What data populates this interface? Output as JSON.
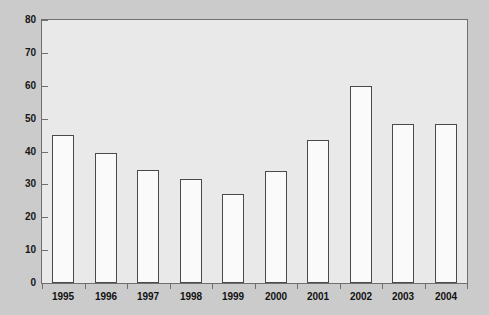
{
  "chart_data": {
    "type": "bar",
    "title": "",
    "subtitle": "",
    "xlabel": "",
    "ylabel": "",
    "categories": [
      "1995",
      "1996",
      "1997",
      "1998",
      "1999",
      "2000",
      "2001",
      "2002",
      "2003",
      "2004"
    ],
    "values": [
      45,
      39.5,
      34.5,
      31.5,
      27,
      34,
      43.5,
      60,
      48.5,
      48.5
    ],
    "series": [
      {
        "name": "value",
        "values": [
          45,
          39.5,
          34.5,
          31.5,
          27,
          34,
          43.5,
          60,
          48.5,
          48.5
        ]
      }
    ],
    "ylim": [
      0,
      80
    ],
    "ytick_labels": [
      "0",
      "10",
      "20",
      "30",
      "40",
      "50",
      "60",
      "70",
      "80"
    ],
    "ytick_values": [
      0,
      10,
      20,
      30,
      40,
      50,
      60,
      70,
      80
    ],
    "grid": false,
    "legend": false,
    "legend_position": "none",
    "annotations": []
  },
  "style": {
    "bar_fill": "#fafafa",
    "bar_border": "#4a4a4a",
    "plot_background": "#e9e9e9",
    "figure_background": "#cbcbcb",
    "axis_color": "#6f6f6f",
    "text_color": "#121212"
  }
}
